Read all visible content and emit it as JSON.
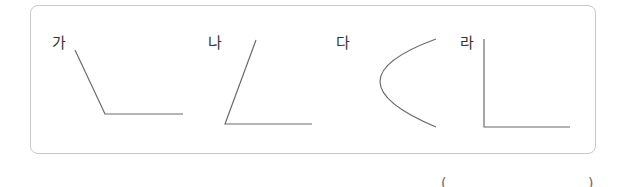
{
  "problem": {
    "figures": [
      {
        "label": "가",
        "shape": "angle-obtuse"
      },
      {
        "label": "나",
        "shape": "angle-acute"
      },
      {
        "label": "다",
        "shape": "curve"
      },
      {
        "label": "라",
        "shape": "angle-right"
      }
    ],
    "answer_box": {
      "open": "(",
      "close": ")",
      "value": ""
    }
  },
  "colors": {
    "line": "#6b6b6b",
    "border": "#c9c9c9",
    "text": "#333333"
  }
}
